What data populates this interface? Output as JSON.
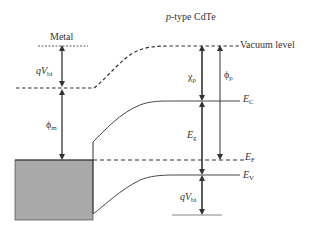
{
  "diagram": {
    "regions": {
      "metal": "Metal",
      "semiconductor_prefix": "p",
      "semiconductor_suffix": "-type CdTe"
    },
    "levels": {
      "vacuum": "Vacuum level",
      "ec": "E",
      "ec_sub": "C",
      "ef": "E",
      "ef_sub": "F",
      "ev": "E",
      "ev_sub": "V"
    },
    "quantities": {
      "qvbi_top_q": "q",
      "qvbi_top_v": "V",
      "qvbi_top_sub": "bi",
      "phi_m": "ϕ",
      "phi_m_sub": "m",
      "chi_p": "χ",
      "chi_p_sub": "p",
      "phi_p": "ϕ",
      "phi_p_sub": "p",
      "eg": "E",
      "eg_sub": "g",
      "qvbi_bottom_q": "q",
      "qvbi_bottom_v": "V",
      "qvbi_bottom_sub": "bi"
    },
    "colors": {
      "line": "#333333",
      "metal_fill": "#a9a9a9"
    }
  }
}
